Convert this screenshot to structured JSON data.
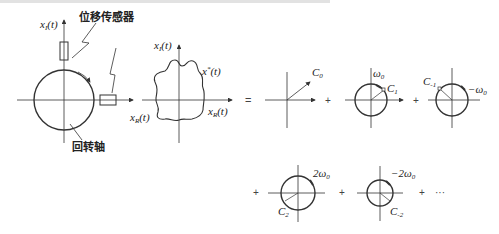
{
  "figure": {
    "sensor_label": "位移传感器",
    "axis_label": "回转轴",
    "left_plot": {
      "y_axis": "x",
      "y_axis_sub": "I",
      "x_axis": "x",
      "x_axis_sub": "R",
      "arg": "(t)"
    },
    "middle_plot": {
      "y_axis": "x",
      "y_axis_sub": "I",
      "x_axis_left": "x",
      "x_axis_left_sub": "R",
      "x_axis_right": "x",
      "x_axis_right_sub": "R",
      "curve_label": "x",
      "curve_sup": "*",
      "arg": "(t)"
    },
    "equals": "=",
    "terms": [
      {
        "coef": "C",
        "sub": "0",
        "freq": ""
      },
      {
        "coef": "C",
        "sub": "1",
        "freq": "ω",
        "freq_sub": "0",
        "freq_prefix": ""
      },
      {
        "coef": "C",
        "sub": "-1",
        "freq": "ω",
        "freq_sub": "0",
        "freq_prefix": "−"
      },
      {
        "coef": "C",
        "sub": "2",
        "freq": "ω",
        "freq_sub": "0",
        "freq_prefix": "2"
      },
      {
        "coef": "C",
        "sub": "-2",
        "freq": "ω",
        "freq_sub": "0",
        "freq_prefix": "−2"
      }
    ],
    "plus": "+",
    "ellipsis": "···"
  }
}
